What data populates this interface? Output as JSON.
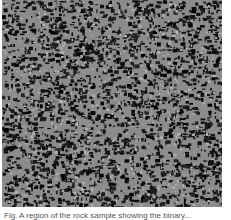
{
  "figure": {
    "image_description": "Binary grayscale texture: gray background with dense irregular black speckles",
    "colors": {
      "background": "#8c8c8c",
      "speckle": "#111111",
      "page": "#ffffff"
    },
    "caption": "Fig.  A region of the rock sample showing the binary..."
  }
}
